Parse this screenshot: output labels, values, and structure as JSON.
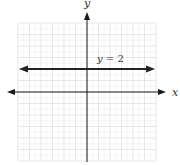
{
  "chart_data": {
    "type": "line",
    "title": "",
    "xlabel": "x",
    "ylabel": "y",
    "xlim": [
      -6,
      6
    ],
    "ylim": [
      -6,
      6
    ],
    "grid": true,
    "grid_major_step": 1,
    "grid_minor_step": 0.5,
    "legend": null,
    "series": [
      {
        "name": "y = 2",
        "equation": "y = 2",
        "x": [
          -6,
          6
        ],
        "y": [
          2,
          2
        ],
        "arrows": "both"
      }
    ],
    "annotations": [
      {
        "text": "y = 2",
        "x": 1.8,
        "y": 2.5
      }
    ]
  },
  "labels": {
    "x_axis": "x",
    "y_axis": "y",
    "equation_var": "y",
    "equation_rest": " = 2"
  },
  "colors": {
    "axis": "#1a1a1a",
    "line": "#222222",
    "grid_major": "#d9d9d9",
    "grid_minor": "#eeeeee",
    "text": "#333333"
  }
}
